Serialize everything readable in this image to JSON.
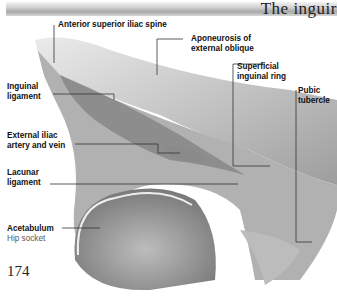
{
  "header": {
    "title": "The inguir"
  },
  "labels": {
    "asis": "Anterior superior iliac spine",
    "aponeurosis_1": "Aponeurosis of",
    "aponeurosis_2": "external oblique",
    "superficial_1": "Superficial",
    "superficial_2": "inguinal ring",
    "pubic_1": "Pubic",
    "pubic_2": "tubercle",
    "inguinal_1": "Inguinal",
    "inguinal_2": "ligament",
    "external_1": "External iliac",
    "external_2": "artery and vein",
    "lacunar_1": "Lacunar",
    "lacunar_2": "ligament",
    "acetabulum": "Acetabulum",
    "acetabulum_sub": "Hip socket"
  },
  "page_number": "174",
  "colors": {
    "leader_line": "#333333",
    "illustration_gray": "#9a9a9a"
  }
}
